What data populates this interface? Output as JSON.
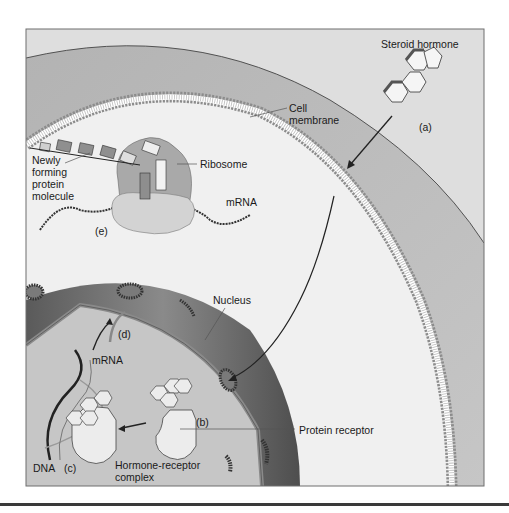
{
  "figure": {
    "colors": {
      "frame_border": "#6e6e6e",
      "extracellular": "#dcdcdc",
      "outer_band": "#b9b9b9",
      "cytoplasm": "#efefef",
      "membrane_head": "#8f8f8f",
      "membrane_tail": "#ffffff",
      "nucleus_envelope": "#6a6a6a",
      "nucleoplasm": "#c4c4c4",
      "receptor": "#ececec",
      "ribosome_large": "#a9a9a9",
      "ribosome_small": "#d3d3d3",
      "text": "#1a1a1a",
      "rule": "#3a3a3a"
    },
    "labels": {
      "steroid_hormone": "Steroid hormone",
      "step_a": "(a)",
      "cell_membrane_line1": "Cell",
      "cell_membrane_line2": "membrane",
      "ribosome": "Ribosome",
      "mrna_cytoplasm": "mRNA",
      "step_e": "(e)",
      "protein_line1": "Newly",
      "protein_line2": "forming",
      "protein_line3": "protein",
      "protein_line4": "molecule",
      "nucleus": "Nucleus",
      "step_d": "(d)",
      "mrna_nucleus": "mRNA",
      "step_b": "(b)",
      "protein_receptor": "Protein receptor",
      "dna": "DNA",
      "step_c": "(c)",
      "complex_line1": "Hormone-receptor",
      "complex_line2": "complex"
    }
  }
}
